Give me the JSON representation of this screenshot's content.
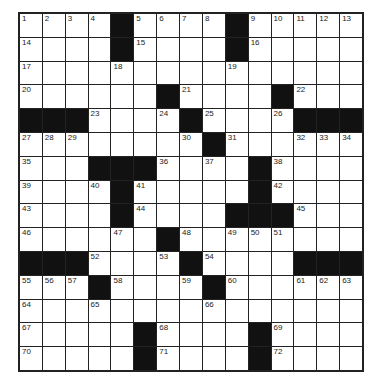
{
  "puzzle": {
    "size": {
      "rows": 15,
      "cols": 15
    },
    "colors": {
      "black": "#111111",
      "white": "#ffffff",
      "border": "#222222"
    },
    "grid": [
      [
        "1",
        "2",
        "3",
        "4",
        "#",
        "5",
        "6",
        "7",
        "8",
        "#",
        "9",
        "10",
        "11",
        "12",
        "13"
      ],
      [
        "14",
        "",
        "",
        "",
        "#",
        "15",
        "",
        "",
        "",
        "#",
        "16",
        "",
        "",
        "",
        ""
      ],
      [
        "17",
        "",
        "",
        "",
        "18",
        "",
        "",
        "",
        "",
        "19",
        "",
        "",
        "",
        "",
        ""
      ],
      [
        "20",
        "",
        "",
        "",
        "",
        "",
        "#",
        "21",
        "",
        "",
        "",
        "#",
        "22",
        "",
        ""
      ],
      [
        "#",
        "#",
        "#",
        "23",
        "",
        "",
        "24",
        "#",
        "25",
        "",
        "",
        "26",
        "#",
        "#",
        "#"
      ],
      [
        "27",
        "28",
        "29",
        "",
        "",
        "",
        "",
        "30",
        "#",
        "31",
        "",
        "",
        "32",
        "33",
        "34"
      ],
      [
        "35",
        "",
        "",
        "#",
        "#",
        "#",
        "36",
        "",
        "37",
        "",
        "#",
        "38",
        "",
        "",
        ""
      ],
      [
        "39",
        "",
        "",
        "40",
        "#",
        "41",
        "",
        "",
        "",
        "",
        "#",
        "42",
        "",
        "",
        ""
      ],
      [
        "43",
        "",
        "",
        "",
        "#",
        "44",
        "",
        "",
        "",
        "#",
        "#",
        "#",
        "45",
        "",
        ""
      ],
      [
        "46",
        "",
        "",
        "",
        "47",
        "",
        "#",
        "48",
        "",
        "49",
        "50",
        "51",
        "",
        "",
        ""
      ],
      [
        "#",
        "#",
        "#",
        "52",
        "",
        "",
        "53",
        "#",
        "54",
        "",
        "",
        "",
        "#",
        "#",
        "#"
      ],
      [
        "55",
        "56",
        "57",
        "#",
        "58",
        "",
        "",
        "59",
        "#",
        "60",
        "",
        "",
        "61",
        "62",
        "63"
      ],
      [
        "64",
        "",
        "",
        "65",
        "",
        "",
        "",
        "",
        "66",
        "",
        "",
        "",
        "",
        "",
        ""
      ],
      [
        "67",
        "",
        "",
        "",
        "",
        "#",
        "68",
        "",
        "",
        "",
        "#",
        "69",
        "",
        "",
        ""
      ],
      [
        "70",
        "",
        "",
        "",
        "",
        "#",
        "71",
        "",
        "",
        "",
        "#",
        "72",
        "",
        "",
        ""
      ]
    ]
  }
}
